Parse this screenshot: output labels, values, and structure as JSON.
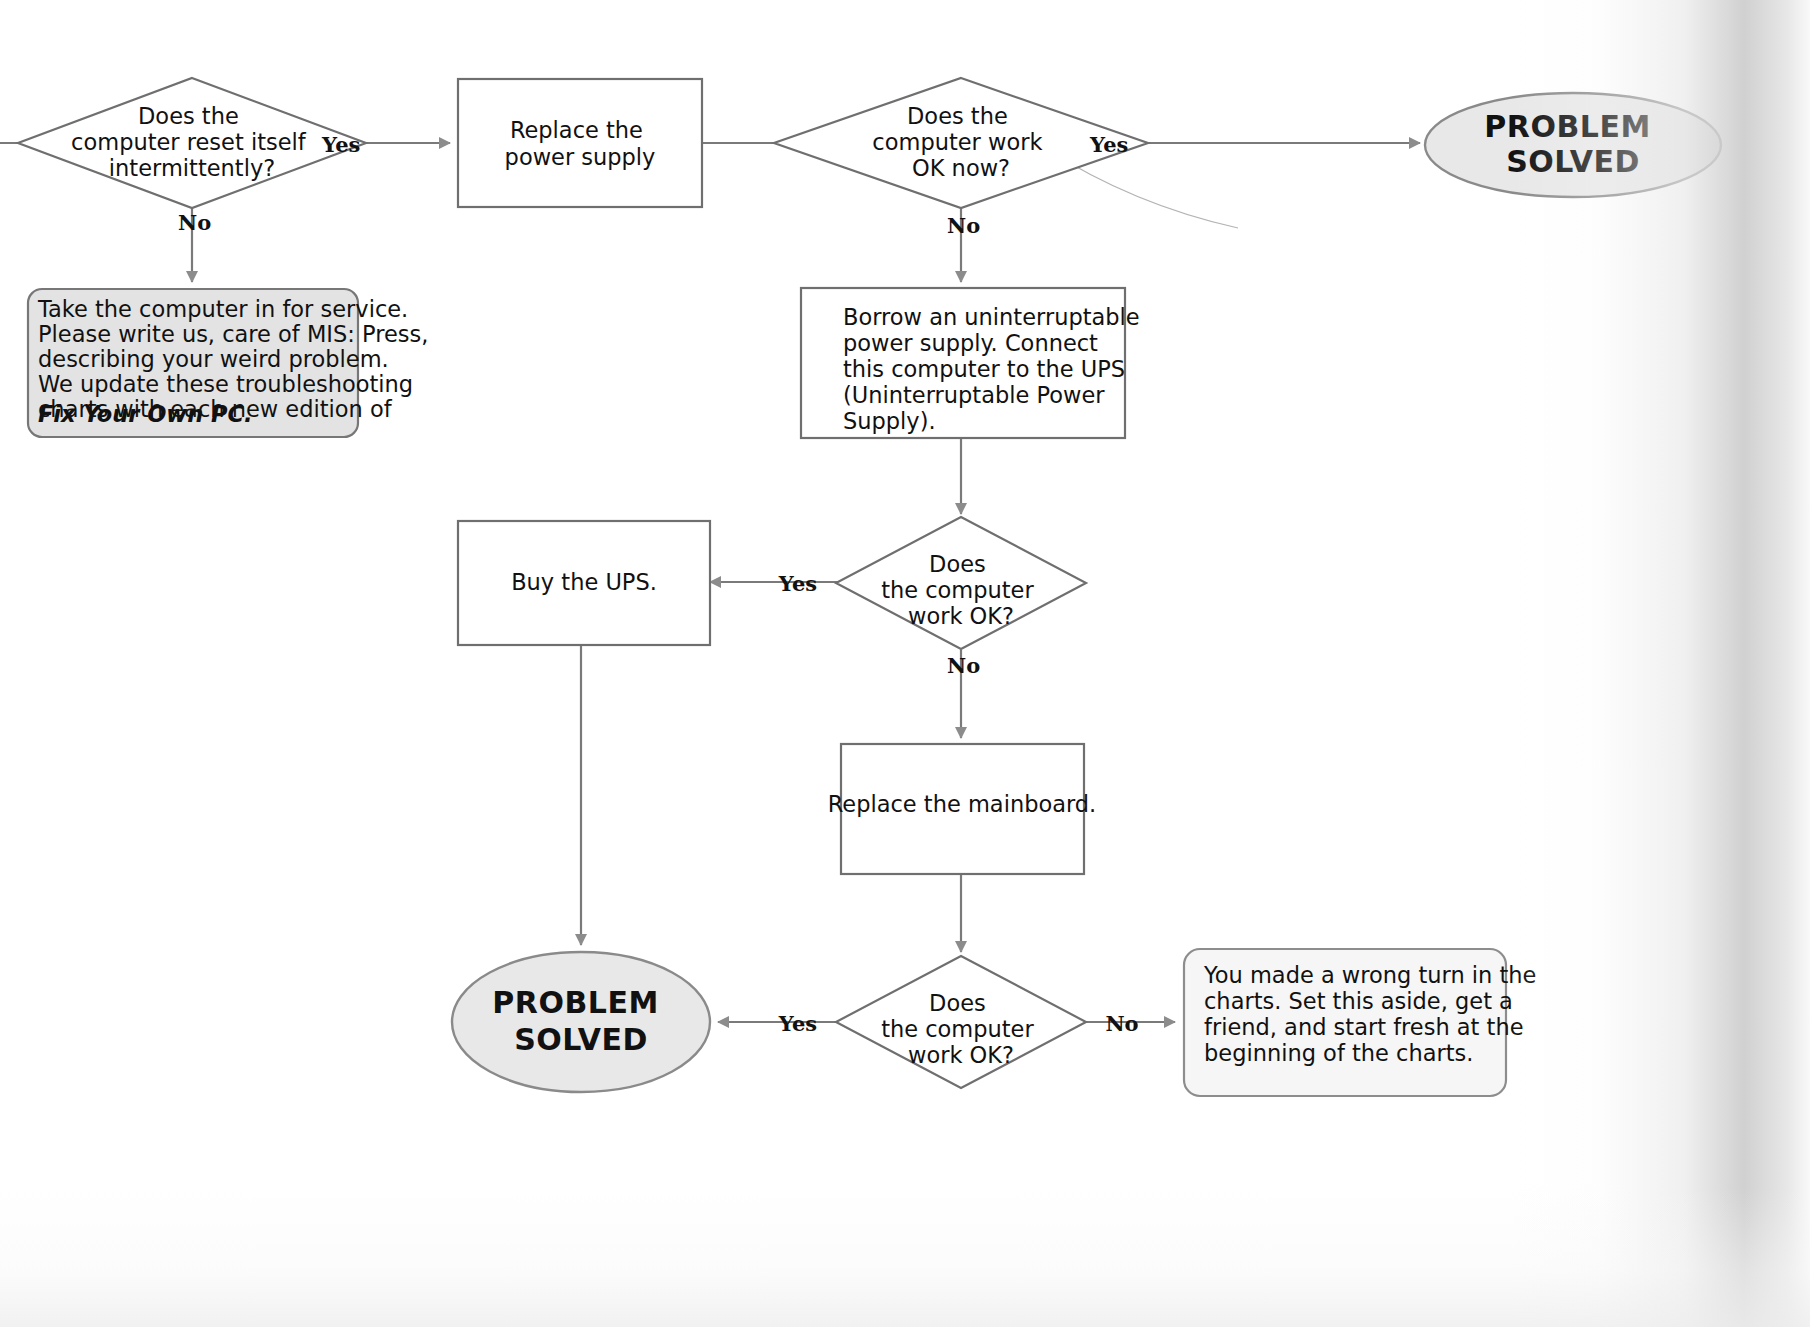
{
  "document": {
    "kind": "troubleshooting-flowchart",
    "topic": "Computer resets itself intermittently"
  },
  "nodes": {
    "decision_reset": {
      "shape": "diamond",
      "lines": [
        "Does the",
        "computer reset itself",
        "intermittently?"
      ]
    },
    "note_service": {
      "shape": "rounded-note",
      "lines": [
        "Take the computer in for service.",
        "Please write us, care of MIS: Press,",
        "describing your weird problem.",
        "We update these troubleshooting",
        "charts with each new edition of"
      ],
      "emphasis_line": "Fix Your Own PC."
    },
    "action_replace_psu": {
      "shape": "rectangle",
      "lines": [
        "Replace the",
        "power supply"
      ]
    },
    "decision_work_now": {
      "shape": "diamond",
      "lines": [
        "Does the",
        "computer work",
        "OK now?"
      ]
    },
    "terminal_solved_top": {
      "shape": "oval",
      "lines": [
        "PROBLEM",
        "SOLVED"
      ]
    },
    "action_borrow_ups": {
      "shape": "rectangle",
      "lines": [
        "Borrow an uninterruptable",
        "power supply.  Connect",
        "this computer to the UPS",
        "(Uninterruptable Power",
        "Supply)."
      ]
    },
    "decision_work_ok_mid": {
      "shape": "diamond",
      "lines": [
        "Does",
        "the computer",
        "work OK?"
      ]
    },
    "action_buy_ups": {
      "shape": "rectangle",
      "lines": [
        "Buy the UPS."
      ]
    },
    "action_replace_mainboard": {
      "shape": "rectangle",
      "lines": [
        "Replace the mainboard."
      ]
    },
    "decision_work_ok_bottom": {
      "shape": "diamond",
      "lines": [
        "Does",
        "the computer",
        "work OK?"
      ]
    },
    "terminal_solved_bottom": {
      "shape": "oval",
      "lines": [
        "PROBLEM",
        "SOLVED"
      ]
    },
    "note_wrong_turn": {
      "shape": "rounded-note",
      "lines": [
        "You made a wrong turn in the",
        "charts.  Set this aside, get a",
        "friend, and start fresh at the",
        "beginning of the charts."
      ]
    }
  },
  "edge_labels": {
    "reset_yes": "Yes",
    "reset_no": "No",
    "work_now_yes": "Yes",
    "work_now_no": "No",
    "work_ok_mid_yes": "Yes",
    "work_ok_mid_no": "No",
    "work_ok_bottom_yes": "Yes",
    "work_ok_bottom_no": "No"
  },
  "colors": {
    "page_background": "#ffffff",
    "line": "#7a7a7a",
    "arrowhead": "#8c8c8c",
    "oval_fill": "#e8e8e8",
    "note_fill": "#e3e3e3",
    "note_fill_light": "#f6f6f6",
    "text": "#111111"
  }
}
